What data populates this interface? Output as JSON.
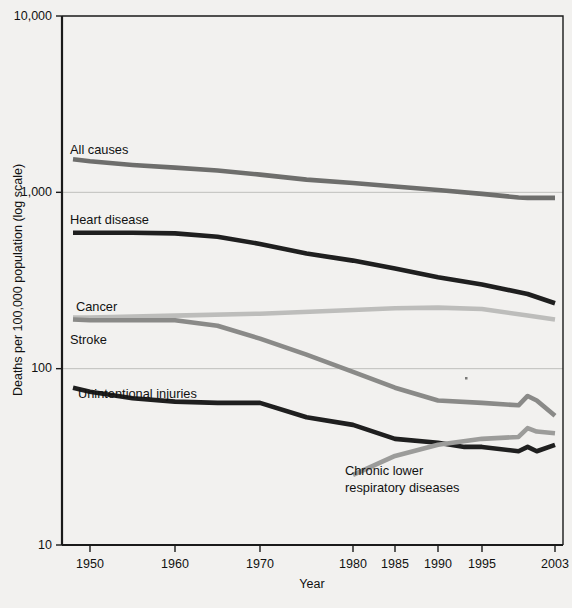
{
  "chart_data": {
    "type": "line",
    "title": "",
    "xlabel": "Year",
    "ylabel": "Deaths per 100,000 population (log scale)",
    "yscale": "log",
    "ylim": [
      10,
      10000
    ],
    "xlim": [
      1948,
      2003
    ],
    "grid": true,
    "legend_position": "inline-labels",
    "y_ticks": [
      "10,000",
      "1,000",
      "100",
      "10"
    ],
    "y_tick_values": [
      10000,
      1000,
      100,
      10
    ],
    "x_ticks": [
      "1950",
      "1960",
      "1970",
      "1980",
      "1985",
      "1990",
      "1995",
      "2003"
    ],
    "x_tick_values": [
      1950,
      1960,
      1970,
      1980,
      1985,
      1990,
      1995,
      2003
    ],
    "series": [
      {
        "name": "All causes",
        "color": "#6e6e6c",
        "label": "All causes",
        "x": [
          1948,
          1950,
          1955,
          1960,
          1965,
          1970,
          1975,
          1980,
          1985,
          1990,
          1995,
          1999,
          2000,
          2003
        ],
        "values": [
          1540,
          1500,
          1430,
          1380,
          1330,
          1260,
          1180,
          1130,
          1080,
          1030,
          980,
          935,
          930,
          930
        ]
      },
      {
        "name": "Heart disease",
        "color": "#1f1f1f",
        "label": "Heart disease",
        "x": [
          1948,
          1950,
          1955,
          1960,
          1965,
          1970,
          1975,
          1980,
          1985,
          1990,
          1995,
          2000,
          2003
        ],
        "values": [
          590,
          590,
          590,
          585,
          560,
          510,
          450,
          410,
          370,
          330,
          300,
          265,
          235
        ]
      },
      {
        "name": "Cancer",
        "color": "#bdbdbb",
        "label": "Cancer",
        "x": [
          1948,
          1950,
          1960,
          1970,
          1980,
          1985,
          1990,
          1995,
          2000,
          2003
        ],
        "values": [
          195,
          195,
          200,
          205,
          215,
          220,
          222,
          218,
          200,
          190
        ]
      },
      {
        "name": "Stroke",
        "color": "#8a8a88",
        "label": "Stroke",
        "x": [
          1948,
          1950,
          1955,
          1960,
          1965,
          1970,
          1975,
          1980,
          1985,
          1990,
          1995,
          1999,
          2000,
          2001,
          2003
        ],
        "values": [
          190,
          188,
          188,
          188,
          175,
          148,
          120,
          96,
          78,
          66,
          64,
          62,
          70,
          66,
          54
        ]
      },
      {
        "name": "Unintentional injuries",
        "color": "#1f1f1f",
        "label": "Unintentional injuries",
        "x": [
          1948,
          1950,
          1955,
          1960,
          1965,
          1970,
          1975,
          1980,
          1985,
          1990,
          1993,
          1995,
          1999,
          2000,
          2001,
          2003
        ],
        "values": [
          78,
          74,
          68,
          65,
          64,
          64,
          53,
          48,
          40,
          38,
          36,
          36,
          34,
          36,
          34,
          37
        ]
      },
      {
        "name": "Chronic lower respiratory diseases",
        "color": "#9c9c9a",
        "label": "Chronic lower\nrespiratory diseases",
        "x": [
          1980,
          1985,
          1990,
          1995,
          1999,
          2000,
          2001,
          2003
        ],
        "values": [
          25,
          32,
          37,
          40,
          41,
          46,
          44,
          43
        ]
      }
    ],
    "series_labels": [
      {
        "text": "All causes",
        "x": 70,
        "y": 154
      },
      {
        "text": "Heart disease",
        "x": 70,
        "y": 224
      },
      {
        "text": "Cancer",
        "x": 76,
        "y": 311
      },
      {
        "text": "Stroke",
        "x": 70,
        "y": 344
      },
      {
        "text": "Unintentional injuries",
        "x": 78,
        "y": 398
      }
    ],
    "annotations": [
      {
        "text_line1": "Chronic lower",
        "text_line2": "respiratory diseases",
        "x": 345,
        "y": 475
      }
    ]
  }
}
